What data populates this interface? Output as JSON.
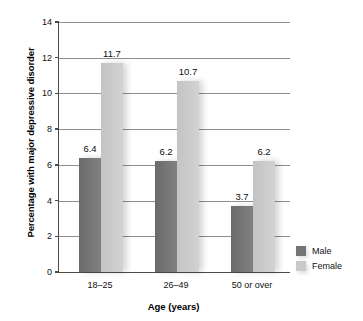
{
  "chart_data": {
    "type": "bar",
    "title": "",
    "subtitle": "",
    "xlabel": "Age (years)",
    "ylabel": "Percentage with major depressive disorder",
    "categories": [
      "18–25",
      "26–49",
      "50 or over"
    ],
    "series": [
      {
        "name": "Male",
        "values": [
          6.4,
          6.2,
          3.7
        ],
        "color": "#747474"
      },
      {
        "name": "Female",
        "values": [
          11.7,
          10.7,
          6.2
        ],
        "color": "#c9c9c9"
      }
    ],
    "ylim": [
      0,
      14
    ],
    "ytick_labels": [
      "0",
      "2",
      "4",
      "6",
      "8",
      "10",
      "12",
      "14"
    ],
    "ytick_values": [
      0,
      2,
      4,
      6,
      8,
      10,
      12,
      14
    ],
    "grid": true,
    "grid_axis": "y",
    "legend_position": "right",
    "data_labels": [
      "6.4",
      "11.7",
      "6.2",
      "10.7",
      "3.7",
      "6.2"
    ],
    "bar_style": "shadowed-gradient"
  },
  "legend": {
    "items": [
      {
        "label": "Male",
        "color": "#747474"
      },
      {
        "label": "Female",
        "color": "#c9c9c9"
      }
    ]
  }
}
